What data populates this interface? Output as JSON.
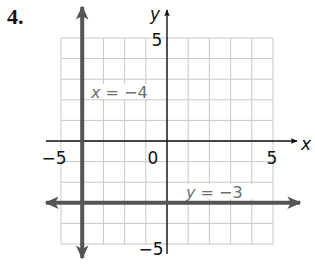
{
  "problem": {
    "number_label": "4."
  },
  "chart_data": {
    "type": "line",
    "title": "",
    "xlabel": "x",
    "ylabel": "y",
    "xlim": [
      -5,
      5
    ],
    "ylim": [
      -5,
      5
    ],
    "grid": true,
    "grid_step": 1,
    "x_tick_labels": [
      {
        "value": -5,
        "label": "−5"
      },
      {
        "value": 0,
        "label": "0"
      },
      {
        "value": 5,
        "label": "5"
      }
    ],
    "y_tick_labels": [
      {
        "value": 5,
        "label": "5"
      },
      {
        "value": -5,
        "label": "−5"
      }
    ],
    "series": [
      {
        "name": "x = −4",
        "kind": "vertical",
        "equation": "x = -4",
        "value": -4,
        "label": "x = −4",
        "label_position": {
          "x": -3.6,
          "y": 2.6
        }
      },
      {
        "name": "y = −3",
        "kind": "horizontal",
        "equation": "y = -3",
        "value": -3,
        "label": "y = −3",
        "label_position": {
          "x": 1.0,
          "y": -2.6
        }
      }
    ],
    "legend": null
  },
  "colors": {
    "grid": "#c8c8c8",
    "axis": "#111111",
    "line": "#555555",
    "label": "#6e6e6e",
    "text": "#111111"
  }
}
